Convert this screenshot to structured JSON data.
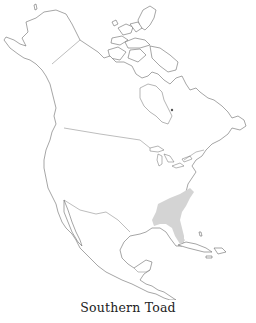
{
  "map": {
    "region": "North America",
    "species": "Southern Toad",
    "range_description": "Southeastern United States coastal plain (Florida, Georgia, South Carolina, North Carolina, Alabama, Mississippi, Louisiana)",
    "colors": {
      "range_fill": "#d4d4d4",
      "outline": "#6a6a6a",
      "background": "#ffffff"
    }
  },
  "caption": "Southern Toad"
}
